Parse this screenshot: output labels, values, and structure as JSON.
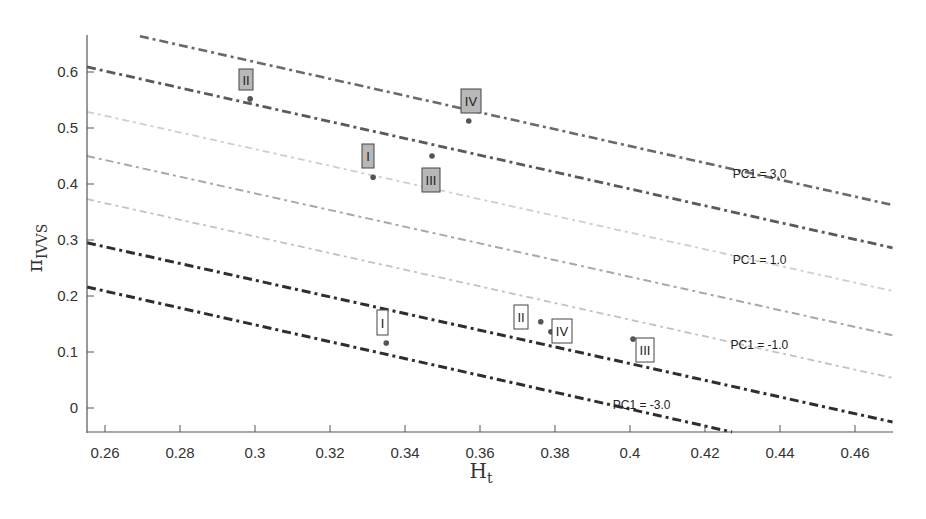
{
  "chart_data": {
    "type": "scatter",
    "title": "",
    "xlabel": "H",
    "xlabel_subscript": "t",
    "ylabel": "π",
    "ylabel_subscript": "IVVS",
    "xlim": [
      0.2552,
      0.47
    ],
    "ylim": [
      -0.045,
      0.665
    ],
    "xticks": [
      0.26,
      0.28,
      0.3,
      0.32,
      0.34,
      0.36,
      0.38,
      0.4,
      0.42,
      0.44,
      0.46
    ],
    "xtick_labels": [
      "0.26",
      "0.28",
      "0.3",
      "0.32",
      "0.34",
      "0.36",
      "0.38",
      "0.4",
      "0.42",
      "0.44",
      "0.46"
    ],
    "yticks": [
      0,
      0.1,
      0.2,
      0.3,
      0.4,
      0.5,
      0.6
    ],
    "ytick_labels": [
      "0",
      "0.1",
      "0.2",
      "0.3",
      "0.4",
      "0.5",
      "0.6"
    ],
    "grid": false,
    "iso_lines": [
      {
        "name": "PC1 = 3.0",
        "x": [
          0.2693,
          0.47
        ],
        "y": [
          0.664,
          0.3625
        ],
        "color": "#6a6a6a",
        "width": 2.6,
        "dash": "9 4 3 4"
      },
      {
        "name": "PC1 = 2.0",
        "x": [
          0.2552,
          0.47
        ],
        "y": [
          0.609,
          0.286
        ],
        "color": "#5a5a5a",
        "width": 2.8,
        "dash": "9 4 3 4"
      },
      {
        "name": "PC1 = 1.0",
        "x": [
          0.2552,
          0.47
        ],
        "y": [
          0.529,
          0.209
        ],
        "color": "#cfcfcf",
        "width": 1.8,
        "dash": "7 4 3 4"
      },
      {
        "name": "PC1 = 0.0",
        "x": [
          0.2552,
          0.47
        ],
        "y": [
          0.45,
          0.13
        ],
        "color": "#a8a8a8",
        "width": 2.0,
        "dash": "8 4 3 4"
      },
      {
        "name": "PC1 = -1.0",
        "x": [
          0.2552,
          0.47
        ],
        "y": [
          0.373,
          0.0536
        ],
        "color": "#c2c2c2",
        "width": 1.8,
        "dash": "7 4 3 4"
      },
      {
        "name": "PC1 = -2.0",
        "x": [
          0.2552,
          0.47
        ],
        "y": [
          0.295,
          -0.025
        ],
        "color": "#2e2e2e",
        "width": 3.0,
        "dash": "9 4 3 4"
      },
      {
        "name": "PC1 = -3.0",
        "x": [
          0.2552,
          0.4272
        ],
        "y": [
          0.216,
          -0.043
        ],
        "color": "#2e2e2e",
        "width": 3.0,
        "dash": "9 4 3 4"
      }
    ],
    "line_labels": [
      {
        "text": "PC1 = 3.0",
        "x": 0.4274,
        "y": 0.41
      },
      {
        "text": "PC1 = 1.0",
        "x": 0.4274,
        "y": 0.258
      },
      {
        "text": "PC1 = -1.0",
        "x": 0.4268,
        "y": 0.106
      },
      {
        "text": "PC1 = -3.0",
        "x": 0.3954,
        "y": -0.001
      }
    ],
    "series": [
      {
        "name": "Group A (shaded labels)",
        "label_style": "gray-box",
        "points": [
          {
            "label": "II",
            "x": 0.2987,
            "y": 0.552
          },
          {
            "label": "I",
            "x": 0.3315,
            "y": 0.412
          },
          {
            "label": "III",
            "x": 0.3472,
            "y": 0.45
          },
          {
            "label": "IV",
            "x": 0.357,
            "y": 0.5125
          }
        ]
      },
      {
        "name": "Group B (outlined labels)",
        "label_style": "white-box",
        "points": [
          {
            "label": "I",
            "x": 0.335,
            "y": 0.116
          },
          {
            "label": "II",
            "x": 0.3762,
            "y": 0.154
          },
          {
            "label": "IV",
            "x": 0.3789,
            "y": 0.136
          },
          {
            "label": "III",
            "x": 0.4008,
            "y": 0.123
          }
        ]
      }
    ]
  },
  "labels": {
    "gray": [
      {
        "text": "II",
        "bx": 239,
        "by": 69,
        "w": 14,
        "h": 21
      },
      {
        "text": "I",
        "bx": 362,
        "by": 144,
        "w": 12,
        "h": 24
      },
      {
        "text": "III",
        "bx": 422,
        "by": 168,
        "w": 18,
        "h": 24
      },
      {
        "text": "IV",
        "bx": 461,
        "by": 89,
        "w": 20,
        "h": 24
      }
    ],
    "white": [
      {
        "text": "I",
        "bx": 377,
        "by": 310,
        "w": 11,
        "h": 25
      },
      {
        "text": "II",
        "bx": 514,
        "by": 305,
        "w": 14,
        "h": 24
      },
      {
        "text": "IV",
        "bx": 552,
        "by": 319,
        "w": 20,
        "h": 24
      },
      {
        "text": "III",
        "bx": 636,
        "by": 338,
        "w": 18,
        "h": 24
      }
    ]
  }
}
